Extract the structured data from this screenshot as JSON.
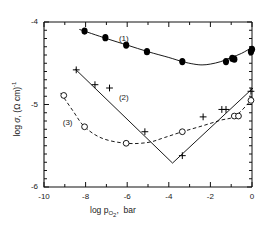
{
  "chart_data": {
    "type": "line",
    "title": "",
    "subtitle": "",
    "xlabel": "log p_O2,  bar",
    "ylabel": "log sigma, (Ohm cm)^-1",
    "xlim": [
      -10,
      0
    ],
    "ylim": [
      -6,
      -4
    ],
    "grid": false,
    "legend_position": "inline-annotations",
    "x_major_ticks": [
      -10,
      -8,
      -6,
      -4,
      -2,
      0
    ],
    "x_major_tick_labels": [
      "-10",
      "-8",
      "-6",
      "-4",
      "-2",
      "0"
    ],
    "x_minor_tick_step": 1,
    "y_major_ticks": [
      -6,
      -5,
      -4
    ],
    "y_major_tick_labels": [
      "-6",
      "-5",
      "-4"
    ],
    "y_minor_tick_step": 0.1,
    "annotations": [
      {
        "text": "(1)",
        "x": -6.4,
        "y": -4.2
      },
      {
        "text": "(2)",
        "x": -6.4,
        "y": -4.92
      },
      {
        "text": "(3)",
        "x": -9.1,
        "y": -5.22
      }
    ],
    "series": [
      {
        "name": "(1)",
        "marker": "filled-circle",
        "line_style": "solid",
        "color": "#000000",
        "points": [
          {
            "x": -8.05,
            "y": -4.11
          },
          {
            "x": -7.05,
            "y": -4.19
          },
          {
            "x": -6.05,
            "y": -4.28
          },
          {
            "x": -5.05,
            "y": -4.36
          },
          {
            "x": -3.35,
            "y": -4.48
          },
          {
            "x": -1.25,
            "y": -4.48
          },
          {
            "x": -0.95,
            "y": -4.44
          },
          {
            "x": -0.85,
            "y": -4.45
          },
          {
            "x": -0.05,
            "y": -4.36
          },
          {
            "x": 0.0,
            "y": -4.33
          }
        ],
        "curve": [
          {
            "x": -8.3,
            "y": -4.09
          },
          {
            "x": -7.0,
            "y": -4.2
          },
          {
            "x": -6.0,
            "y": -4.28
          },
          {
            "x": -5.0,
            "y": -4.36
          },
          {
            "x": -4.0,
            "y": -4.43
          },
          {
            "x": -3.35,
            "y": -4.48
          },
          {
            "x": -2.8,
            "y": -4.51
          },
          {
            "x": -2.4,
            "y": -4.52
          },
          {
            "x": -2.0,
            "y": -4.51
          },
          {
            "x": -1.5,
            "y": -4.48
          },
          {
            "x": -1.0,
            "y": -4.43
          },
          {
            "x": -0.5,
            "y": -4.38
          },
          {
            "x": 0.05,
            "y": -4.3
          }
        ]
      },
      {
        "name": "(2)",
        "marker": "plus",
        "line_style": "solid",
        "color": "#000000",
        "points": [
          {
            "x": -8.45,
            "y": -4.58
          },
          {
            "x": -7.55,
            "y": -4.76
          },
          {
            "x": -6.85,
            "y": -4.8
          },
          {
            "x": -5.15,
            "y": -5.33
          },
          {
            "x": -3.35,
            "y": -5.62
          },
          {
            "x": -2.35,
            "y": -5.15
          },
          {
            "x": -1.45,
            "y": -5.06
          },
          {
            "x": -1.25,
            "y": -5.06
          },
          {
            "x": -0.05,
            "y": -4.84
          }
        ],
        "curve": [
          {
            "x": -8.5,
            "y": -4.57
          },
          {
            "x": -3.82,
            "y": -5.71
          },
          {
            "x": 0.05,
            "y": -4.8
          }
        ]
      },
      {
        "name": "(3)",
        "marker": "open-circle",
        "line_style": "dashed",
        "color": "#000000",
        "points": [
          {
            "x": -9.05,
            "y": -4.89
          },
          {
            "x": -8.05,
            "y": -5.27
          },
          {
            "x": -6.05,
            "y": -5.47
          },
          {
            "x": -3.35,
            "y": -5.33
          },
          {
            "x": -0.85,
            "y": -5.14
          },
          {
            "x": -0.65,
            "y": -5.14
          },
          {
            "x": -0.05,
            "y": -4.95
          }
        ],
        "curve": [
          {
            "x": -9.2,
            "y": -4.86
          },
          {
            "x": -8.6,
            "y": -5.08
          },
          {
            "x": -8.05,
            "y": -5.27
          },
          {
            "x": -7.2,
            "y": -5.41
          },
          {
            "x": -6.05,
            "y": -5.47
          },
          {
            "x": -5.0,
            "y": -5.46
          },
          {
            "x": -4.2,
            "y": -5.4
          },
          {
            "x": -3.35,
            "y": -5.33
          },
          {
            "x": -2.4,
            "y": -5.26
          },
          {
            "x": -1.5,
            "y": -5.19
          },
          {
            "x": -0.8,
            "y": -5.14
          },
          {
            "x": -0.05,
            "y": -4.95
          }
        ]
      }
    ]
  }
}
